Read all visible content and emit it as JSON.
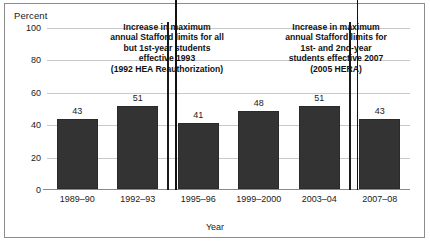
{
  "chart_data": {
    "type": "bar",
    "title": "",
    "ylabel": "Percent",
    "xlabel": "Year",
    "categories": [
      "1989–90",
      "1992–93",
      "1995–96",
      "1999–2000",
      "2003–04",
      "2007–08"
    ],
    "values": [
      43,
      51,
      41,
      48,
      51,
      43
    ],
    "value_labels": [
      "43",
      "51",
      "41",
      "48",
      "51",
      "43"
    ],
    "ylim": [
      0,
      100
    ],
    "yticks": [
      0,
      20,
      40,
      60,
      80,
      100
    ],
    "ytick_labels": [
      "0",
      "20",
      "40",
      "60",
      "80",
      "100"
    ],
    "grid": true,
    "legend": false,
    "bar_color": "#333333",
    "gridline_color": "#c9c9c9",
    "annotations": [
      {
        "name": "annotation-1992-hea",
        "lines": [
          "Increase in maximum",
          "annual  Stafford limits for all",
          "but 1st-year  students",
          "effective 1993",
          "(1992 HEA Reauthorization)"
        ],
        "arrow_at_category_boundary": "between 1992–93 and 1995–96"
      },
      {
        "name": "annotation-2005-hera",
        "lines": [
          "Increase in  maximum",
          "annual Stafford limits for",
          "1st- and 2nd-year",
          "students effective 2007",
          "(2005 HERA)"
        ],
        "arrow_at_category_boundary": "between 2003–04 and 2007–08"
      }
    ]
  }
}
